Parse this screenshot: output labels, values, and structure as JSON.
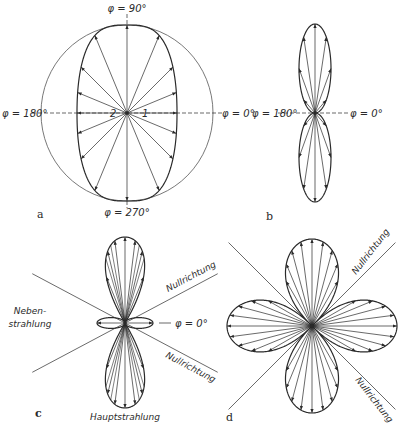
{
  "figure": {
    "panels": [
      {
        "id": "a",
        "label": "a",
        "center": [
          127,
          113
        ],
        "circle_radius": [
          86,
          88
        ],
        "pattern": "cos_plus_const",
        "scale": [
          50,
          88
        ],
        "spoke_step_deg": 22.5,
        "angle_labels": {
          "top": "φ = 90°",
          "bottom": "φ = 270°",
          "left": "φ = 180°",
          "right": "φ = 0°"
        },
        "inner_labels": {
          "left": "2",
          "right": "1"
        }
      },
      {
        "id": "b",
        "label": "b",
        "center": [
          315,
          113
        ],
        "pattern": "figure_eight_vertical",
        "scale": [
          32,
          89
        ],
        "spoke_step_deg": 22.5,
        "angle_labels": {
          "left": "φ = 180°",
          "right": "φ = 0°"
        }
      },
      {
        "id": "c",
        "label": "c",
        "center": [
          125,
          323
        ],
        "pattern": "main_and_side_lobes",
        "main_lobe_top": 86,
        "main_lobe_bottom": 85,
        "main_lobe_width": 34,
        "side_lobe_length": 28,
        "side_lobe_width": 6,
        "null_angle_deg": 28,
        "labels": {
          "side_lobe": [
            "Neben-",
            "strahlung"
          ],
          "main_lobe": "Hauptstrahlung",
          "null_dir": "Nullrichtung",
          "phi": "φ = 0°"
        }
      },
      {
        "id": "d",
        "label": "d",
        "center": [
          312,
          326
        ],
        "pattern": "four_leaf",
        "vertical_lobe_length": 87,
        "horizontal_lobe_length": 85,
        "lobe_width": 35,
        "null_angle_deg": 45,
        "labels": {
          "null_dir": "Nullrichtung"
        }
      }
    ],
    "colors": {
      "ink": "#2a2a2a",
      "circle": "#555555",
      "background": "#ffffff"
    }
  }
}
